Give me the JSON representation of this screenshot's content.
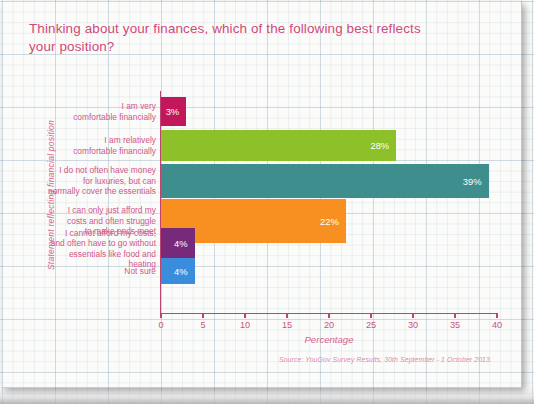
{
  "chart_data": {
    "type": "bar",
    "orientation": "horizontal",
    "title": "Thinking about your finances, which of the following best reflects your position?",
    "xlabel": "Percentage",
    "ylabel": "Statement reflecting financial position",
    "xlim": [
      0,
      40
    ],
    "xticks": [
      0,
      5,
      10,
      15,
      20,
      25,
      30,
      35,
      40
    ],
    "grid": true,
    "legend": "none",
    "source": "Source: YouGov Survey Results, 30th September - 1 October 2013.",
    "categories": [
      "I am very comfortable financially",
      "I am relatively comfortable financially",
      "I do not often have money for luxuries, but can normally cover the essentials",
      "I can only just afford my costs and often struggle to make ends meet",
      "I cannot afford my costs, and often have to go without essentials like food and heating",
      "Not sure"
    ],
    "category_lines": [
      [
        "I am very",
        "comfortable financially"
      ],
      [
        "I am relatively",
        "comfortable financially"
      ],
      [
        "I do not often have money",
        "for luxuries, but can",
        "normally cover the essentials"
      ],
      [
        "I can only just afford my",
        "costs and often struggle",
        "to make ends meet"
      ],
      [
        "I cannot afford my costs,",
        "and often have to go without",
        "essentials like food and heating"
      ],
      [
        "Not sure"
      ]
    ],
    "values": [
      3,
      28,
      39,
      22,
      4,
      4
    ],
    "value_labels": [
      "3%",
      "28%",
      "39%",
      "22%",
      "4%",
      "4%"
    ],
    "colors": [
      "#c2185b",
      "#8dc12a",
      "#3d8e8c",
      "#f79021",
      "#77297a",
      "#3a8ddd"
    ]
  },
  "theme": {
    "title_color": "#cf4a78",
    "axis_color": "#c0436f",
    "label_color": "#d2578a",
    "axis_title_color": "#d8608f",
    "source_color": "#e08bad",
    "page_background": "#fbfbfa"
  }
}
